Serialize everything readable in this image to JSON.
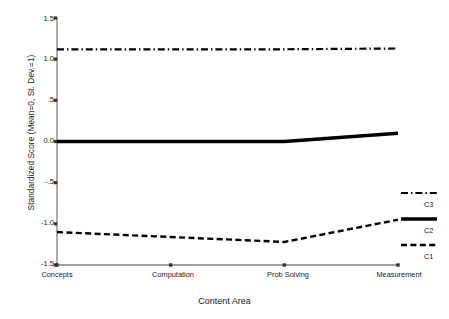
{
  "chart_data": {
    "type": "line",
    "title": "",
    "xlabel": "Content Area",
    "ylabel": "Standardized Score (Mean=0, St. Dev.=1)",
    "categories": [
      "Concepts",
      "Computation",
      "Prob Solving",
      "Measurement"
    ],
    "ylim": [
      -1.5,
      1.5
    ],
    "yticks": [
      1.5,
      1.0,
      0.5,
      0.0,
      -0.5,
      -1.0,
      -1.5
    ],
    "ytick_labels": [
      "1.5",
      "1.0",
      ".5",
      "0.0",
      "-.5",
      "-1.0",
      "-1.5"
    ],
    "grid": false,
    "legend_position": "right",
    "series": [
      {
        "name": "C3",
        "values": [
          1.12,
          1.12,
          1.12,
          1.13
        ],
        "style": "dash-dot",
        "color": "#000000",
        "width": 2.2
      },
      {
        "name": "C2",
        "values": [
          0.0,
          0.0,
          0.0,
          0.1
        ],
        "style": "solid",
        "color": "#000000",
        "width": 3.4
      },
      {
        "name": "C1",
        "values": [
          -1.1,
          -1.16,
          -1.22,
          -0.95
        ],
        "style": "dashed",
        "color": "#000000",
        "width": 2.4
      }
    ]
  },
  "legend": {
    "entries": [
      {
        "label": "C3",
        "style": "dash-dot"
      },
      {
        "label": "C2",
        "style": "solid"
      },
      {
        "label": "C1",
        "style": "dashed"
      }
    ]
  },
  "axis": {
    "color": "#808080"
  }
}
